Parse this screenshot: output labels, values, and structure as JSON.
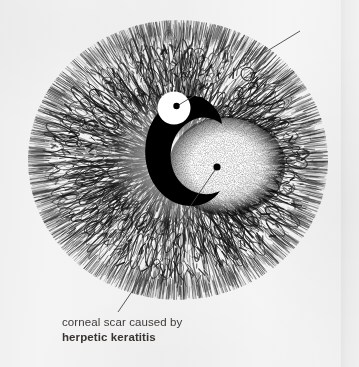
{
  "figure": {
    "kind": "medical-illustration",
    "technique": "pen-and-ink stipple drawing",
    "background_color": "#f2f2f2",
    "ink_color": "#1a1a1a",
    "label_color": "#3f3a36"
  },
  "labels": {
    "light_reflection": {
      "line1": "light",
      "line2": "reflection"
    },
    "corneal_scar": {
      "line1": "corneal scar caused by",
      "line2": "herpetic keratitis"
    }
  },
  "structures": [
    {
      "name": "cornea",
      "description": "radially striated corneal disc filling the frame",
      "center": [
        178,
        160
      ],
      "radius_x": 150,
      "radius_y": 140
    },
    {
      "name": "light-reflection",
      "description": "white specular highlight disc",
      "center": [
        174,
        108
      ],
      "radius": 16,
      "fill": "#ffffff"
    },
    {
      "name": "pupil-shadow",
      "description": "black crescent shadow opening to the right",
      "fill": "#000000"
    },
    {
      "name": "corneal-scar",
      "description": "pale stippled oval opacity, herpetic keratitis scar",
      "center": [
        227,
        166
      ],
      "radius_x": 54,
      "radius_y": 46,
      "fill": "#fbfbfb"
    }
  ],
  "leaders": [
    {
      "name": "light-reflection-leader",
      "from": [
        176,
        106
      ],
      "to": [
        300,
        30
      ],
      "dot_at": "from"
    },
    {
      "name": "corneal-scar-leader",
      "from": [
        217,
        167
      ],
      "to": [
        118,
        312
      ],
      "dot_at": "from"
    }
  ]
}
